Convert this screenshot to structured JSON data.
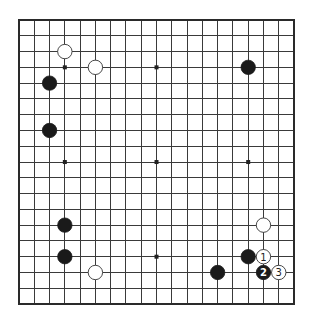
{
  "board": {
    "size": 19,
    "origin": {
      "x": 19,
      "y": 20
    },
    "spacing": {
      "x": 15.28,
      "y": 15.78
    },
    "stone_radius": 7.2,
    "colors": {
      "line": "#3a3a3a",
      "black_stone": "#1a1a1a",
      "white_stone": "#ffffff",
      "background": "#ffffff"
    },
    "hoshi": [
      {
        "col": 3,
        "row": 3
      },
      {
        "col": 9,
        "row": 3
      },
      {
        "col": 15,
        "row": 3
      },
      {
        "col": 3,
        "row": 9
      },
      {
        "col": 9,
        "row": 9
      },
      {
        "col": 15,
        "row": 9
      },
      {
        "col": 3,
        "row": 15
      },
      {
        "col": 9,
        "row": 15
      },
      {
        "col": 15,
        "row": 15
      }
    ],
    "stones": [
      {
        "color": "white",
        "col": 3,
        "row": 2,
        "label": ""
      },
      {
        "color": "white",
        "col": 5,
        "row": 3,
        "label": ""
      },
      {
        "color": "black",
        "col": 2,
        "row": 4,
        "label": ""
      },
      {
        "color": "black",
        "col": 2,
        "row": 7,
        "label": ""
      },
      {
        "color": "black",
        "col": 15,
        "row": 3,
        "label": ""
      },
      {
        "color": "black",
        "col": 3,
        "row": 13,
        "label": ""
      },
      {
        "color": "black",
        "col": 3,
        "row": 15,
        "label": ""
      },
      {
        "color": "white",
        "col": 5,
        "row": 16,
        "label": ""
      },
      {
        "color": "white",
        "col": 16,
        "row": 13,
        "label": ""
      },
      {
        "color": "black",
        "col": 15,
        "row": 15,
        "label": ""
      },
      {
        "color": "black",
        "col": 13,
        "row": 16,
        "label": ""
      },
      {
        "color": "white",
        "col": 16,
        "row": 15,
        "label": "1"
      },
      {
        "color": "black",
        "col": 16,
        "row": 16,
        "label": "2"
      },
      {
        "color": "white",
        "col": 17,
        "row": 16,
        "label": "3"
      }
    ]
  }
}
